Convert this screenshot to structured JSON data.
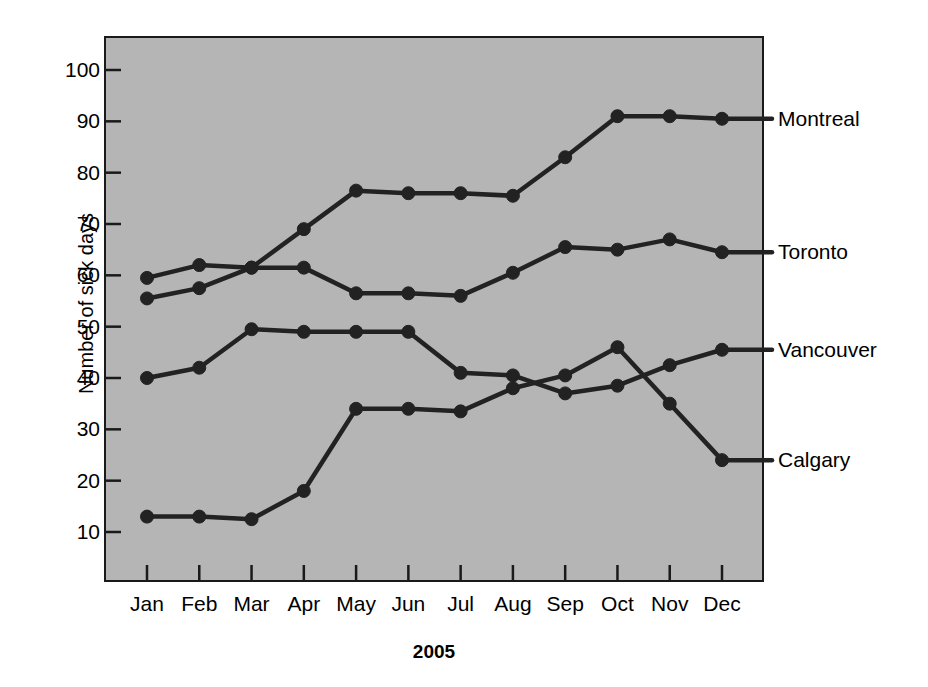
{
  "chart_data": {
    "type": "line",
    "title": "",
    "xlabel": "2005",
    "ylabel": "Number of sick days",
    "categories": [
      "Jan",
      "Feb",
      "Mar",
      "Apr",
      "May",
      "Jun",
      "Jul",
      "Aug",
      "Sep",
      "Oct",
      "Nov",
      "Dec"
    ],
    "ylim": [
      0,
      105
    ],
    "yticks": [
      10,
      20,
      30,
      40,
      50,
      60,
      70,
      80,
      90,
      100
    ],
    "ytick_labels": [
      "10",
      "20",
      "30",
      "40",
      "50",
      "60",
      "70",
      "80",
      "90",
      "100"
    ],
    "grid": false,
    "legend_position": "right-of-plot-direct-labels",
    "series": [
      {
        "name": "Montreal",
        "label": "Montreal",
        "color": "#222222",
        "values": [
          59.5,
          62,
          61.5,
          69,
          76.5,
          76,
          76,
          75.5,
          83,
          91,
          91,
          90.5
        ]
      },
      {
        "name": "Toronto",
        "label": "Toronto",
        "color": "#222222",
        "values": [
          55.5,
          57.5,
          61.5,
          61.5,
          56.5,
          56.5,
          56,
          60.5,
          65.5,
          65,
          67,
          64.5
        ]
      },
      {
        "name": "Vancouver",
        "label": "Vancouver",
        "color": "#222222",
        "values": [
          40,
          42,
          49.5,
          49,
          49,
          49,
          41,
          40.5,
          37,
          38.5,
          42.5,
          45.5
        ]
      },
      {
        "name": "Calgary",
        "label": "Calgary",
        "color": "#222222",
        "values": [
          13,
          13,
          12.5,
          18,
          34,
          34,
          33.5,
          38,
          40.5,
          46,
          35,
          24
        ]
      }
    ]
  },
  "style": {
    "plot_background": "#b5b5b5",
    "page_background": "#ffffff",
    "line_color": "#222222",
    "axis_color": "#1a1a1a",
    "text_color": "#000000"
  }
}
